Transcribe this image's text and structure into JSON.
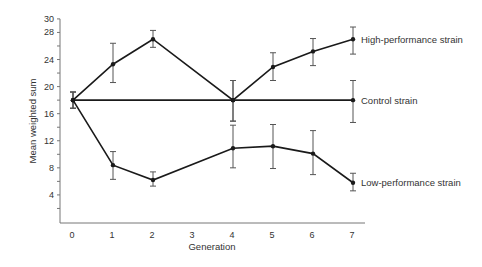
{
  "chart_data": {
    "type": "line",
    "title": "",
    "xlabel": "Generation",
    "ylabel": "Mean weighted sum",
    "x_ticks": [
      "0",
      "1",
      "2",
      "3",
      "4",
      "5",
      "6",
      "7"
    ],
    "y_tick_labels": [
      "4",
      "8",
      "12",
      "16",
      "20",
      "24",
      "28",
      "30"
    ],
    "y_minor_tick_step": 2,
    "ylim": [
      0,
      30
    ],
    "xlim": [
      0,
      7
    ],
    "grid": false,
    "legend_position": "inline-right",
    "series": [
      {
        "name": "High-performance strain",
        "x": [
          0,
          1,
          2,
          4,
          5,
          6,
          7
        ],
        "values": [
          18,
          23.3,
          27.0,
          18,
          22.9,
          25.2,
          27.0
        ],
        "error_low": [
          16.8,
          20.6,
          25.8,
          14.9,
          20.9,
          23.1,
          24.8
        ],
        "error_high": [
          19.2,
          26.4,
          28.3,
          20.9,
          25.0,
          27.1,
          28.8
        ]
      },
      {
        "name": "Control strain",
        "x": [
          0,
          4,
          7
        ],
        "values": [
          18,
          18,
          18
        ],
        "error_low": [
          16.8,
          14.9,
          14.7
        ],
        "error_high": [
          19.2,
          20.9,
          20.9
        ]
      },
      {
        "name": "Low-performance strain",
        "x": [
          0,
          1,
          2,
          4,
          5,
          6,
          7
        ],
        "values": [
          18,
          8.4,
          6.2,
          10.9,
          11.2,
          10.1,
          5.8
        ],
        "error_low": [
          16.8,
          6.3,
          5.3,
          8.0,
          7.9,
          7.0,
          4.6
        ],
        "error_high": [
          19.2,
          10.4,
          7.4,
          14.3,
          14.4,
          13.5,
          7.2
        ]
      }
    ]
  },
  "colors": {
    "line": "#1a1a1a",
    "error_bar": "#555555",
    "axis": "#777777",
    "text": "#333333"
  }
}
